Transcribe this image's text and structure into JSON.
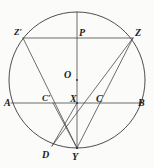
{
  "figure": {
    "type": "geometry-diagram",
    "canvas": {
      "width": 154,
      "height": 168
    },
    "background_color": "#fbfbfa",
    "stroke_color": "#3a3a3a",
    "label_color": "#1a1a1a"
  },
  "circle": {
    "name": "main-circle",
    "center_x": 77,
    "center_y": 80,
    "radius": 68,
    "center_label": "O"
  },
  "points": [
    {
      "id": "Zprime",
      "label": "Z′",
      "x": 23,
      "y": 38,
      "label_x": 14,
      "label_y": 28
    },
    {
      "id": "P",
      "label": "P",
      "x": 77,
      "y": 38,
      "label_x": 79,
      "label_y": 28
    },
    {
      "id": "Z",
      "label": "Z",
      "x": 133,
      "y": 38,
      "label_x": 135,
      "label_y": 28
    },
    {
      "id": "O",
      "label": "O",
      "x": 77,
      "y": 80,
      "label_x": 64,
      "label_y": 70
    },
    {
      "id": "A",
      "label": "A",
      "x": 11,
      "y": 103,
      "label_x": 4,
      "label_y": 98
    },
    {
      "id": "Cprime",
      "label": "C′",
      "x": 53,
      "y": 103,
      "label_x": 42,
      "label_y": 94
    },
    {
      "id": "X",
      "label": "X",
      "x": 77,
      "y": 103,
      "label_x": 70,
      "label_y": 94
    },
    {
      "id": "C",
      "label": "C",
      "x": 98,
      "y": 103,
      "label_x": 96,
      "label_y": 94
    },
    {
      "id": "B",
      "label": "B",
      "x": 143,
      "y": 103,
      "label_x": 138,
      "label_y": 98
    },
    {
      "id": "D",
      "label": "D",
      "x": 52,
      "y": 146,
      "label_x": 42,
      "label_y": 150
    },
    {
      "id": "Y",
      "label": "Y",
      "x": 77,
      "y": 148,
      "label_x": 72,
      "label_y": 152
    }
  ],
  "segments": [
    {
      "name": "chord-zprime-z",
      "from": "Zprime",
      "to": "Z",
      "x1": 23,
      "y1": 38,
      "x2": 133,
      "y2": 38
    },
    {
      "name": "chord-a-b",
      "from": "A",
      "to": "B",
      "x1": 11,
      "y1": 103,
      "x2": 143,
      "y2": 103
    },
    {
      "name": "diameter-p-y",
      "from": "P",
      "to": "Y",
      "x1": 77,
      "y1": 12,
      "x2": 77,
      "y2": 148
    },
    {
      "name": "chord-zprime-y",
      "from": "Zprime",
      "to": "Y",
      "x1": 23,
      "y1": 38,
      "x2": 77,
      "y2": 148
    },
    {
      "name": "chord-z-y",
      "from": "Z",
      "to": "Y",
      "x1": 133,
      "y1": 38,
      "x2": 77,
      "y2": 148
    },
    {
      "name": "chord-z-d",
      "from": "Z",
      "to": "D",
      "x1": 133,
      "y1": 38,
      "x2": 52,
      "y2": 146
    },
    {
      "name": "segment-cprime-y",
      "from": "Cprime",
      "to": "Y",
      "x1": 53,
      "y1": 103,
      "x2": 77,
      "y2": 148
    },
    {
      "name": "segment-d-x",
      "from": "D",
      "to": "X",
      "x1": 52,
      "y1": 146,
      "x2": 77,
      "y2": 103
    }
  ]
}
